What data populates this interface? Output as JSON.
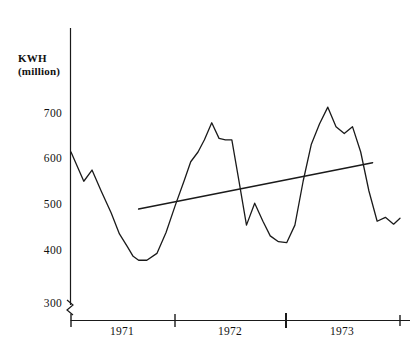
{
  "chart_data": {
    "type": "line",
    "title": "",
    "subtitle": "",
    "xlabel": "",
    "ylabel": "KWH\n(million)",
    "ylabel_line1": "KWH",
    "ylabel_line2": "(million)",
    "ylim": [
      300,
      760
    ],
    "xlim": [
      0,
      36
    ],
    "grid": false,
    "legend": "none",
    "axis_break": true,
    "axis_break_symbol": "zigzag",
    "yticks": [
      300,
      400,
      500,
      600,
      700
    ],
    "ytick_labels": [
      "300",
      "400",
      "500",
      "600",
      "700"
    ],
    "xticks": [
      0,
      12,
      24,
      36
    ],
    "xtick_labels": [
      "",
      "",
      "",
      ""
    ],
    "x_category_labels": [
      "1971",
      "1972",
      "1973"
    ],
    "series": [
      {
        "name": "monthly-kwh",
        "type": "line",
        "x": [
          0,
          1.4,
          2.3,
          3.3,
          4.4,
          5.3,
          6.2,
          6.8,
          7.4,
          8.3,
          9.4,
          10.4,
          11.4,
          12.4,
          13.1,
          13.9,
          14.6,
          15.4,
          16.2,
          16.9,
          17.6,
          18.4,
          19.2,
          20.1,
          21.0,
          21.8,
          22.7,
          23.6,
          24.5,
          25.4,
          26.3,
          27.2,
          28.1,
          29.0,
          29.9,
          30.8,
          31.7,
          32.6,
          33.5,
          34.4,
          35.3,
          36.0
        ],
        "values": [
          620,
          560,
          583,
          540,
          495,
          452,
          425,
          406,
          398,
          398,
          412,
          455,
          510,
          562,
          600,
          620,
          645,
          680,
          648,
          645,
          645,
          558,
          470,
          515,
          478,
          448,
          436,
          434,
          470,
          560,
          636,
          678,
          712,
          672,
          658,
          672,
          620,
          540,
          478,
          486,
          472,
          484
        ]
      },
      {
        "name": "trend-line",
        "type": "line",
        "x": [
          7.4,
          33.0
        ],
        "values": [
          503,
          598
        ]
      }
    ],
    "annotations": []
  },
  "axes": {
    "y_axis_name": "kwh-millions",
    "x_axis_name": "year-timeline"
  }
}
